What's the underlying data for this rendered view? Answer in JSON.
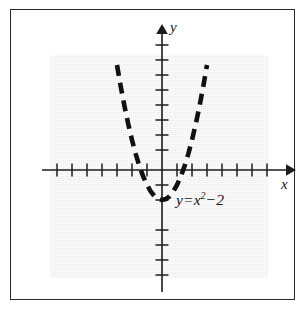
{
  "figure": {
    "kind": "cartesian-graph",
    "frame_border_color": "#2b2b2b",
    "shade_color": "#ededed",
    "curve_color": "#111111",
    "axis_color": "#1c1c1c",
    "x_axis_label": "x",
    "y_axis_label": "y",
    "equation": {
      "lhs": "y",
      "equals": "=",
      "base": "x",
      "exponent": "2",
      "minus": "−",
      "constant": "2",
      "full_text": "y = x² − 2"
    }
  },
  "chart_data": {
    "type": "line",
    "title": "",
    "xlabel": "x",
    "ylabel": "y",
    "xlim": [
      -8,
      8.7
    ],
    "ylim": [
      -8,
      9.6
    ],
    "grid": false,
    "legend": "none",
    "annotations": [
      {
        "text": "y = x² − 2",
        "x": 1.1,
        "y": -2.3
      }
    ],
    "axes": {
      "x_tick_interval": 1,
      "y_tick_interval": 1,
      "x_ticks": [
        -8,
        -7,
        -6,
        -5,
        -4,
        -3,
        -2,
        -1,
        1,
        2,
        3,
        4,
        5,
        6,
        7,
        8
      ],
      "y_ticks": [
        -8,
        -7,
        -6,
        -5,
        -4,
        -3,
        -2,
        -1,
        1,
        2,
        3,
        4,
        5,
        6,
        7,
        8
      ],
      "x_tick_labels": [],
      "y_tick_labels": [],
      "x_arrow": true,
      "y_arrow": true
    },
    "series": [
      {
        "name": "y = x² − 2",
        "linestyle": "dashed",
        "color": "#111111",
        "vertex": [
          0,
          -2
        ],
        "roots": [
          -1.414,
          1.414
        ],
        "x": [
          -3.3,
          -3.0,
          -2.75,
          -2.5,
          -2.25,
          -2.0,
          -1.75,
          -1.5,
          -1.25,
          -1.0,
          -0.75,
          -0.5,
          -0.25,
          0,
          0.25,
          0.5,
          0.75,
          1.0,
          1.25,
          1.5,
          1.75,
          2.0,
          2.25,
          2.5,
          2.75,
          3.0,
          3.3
        ],
        "values": [
          8.89,
          7.0,
          5.5625,
          4.25,
          3.0625,
          2.0,
          1.0625,
          0.25,
          -0.4375,
          -1.0,
          -1.4375,
          -1.75,
          -1.9375,
          -2.0,
          -1.9375,
          -1.75,
          -1.4375,
          -1.0,
          -0.4375,
          0.25,
          1.0625,
          2.0,
          3.0625,
          4.25,
          5.5625,
          7.0,
          8.89
        ]
      }
    ]
  }
}
